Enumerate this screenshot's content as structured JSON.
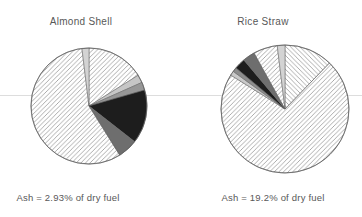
{
  "figure": {
    "background": "#ffffff",
    "text_color": "#585858",
    "baseline_rule_color": "#d9d9d9",
    "hatch_line_color": "#a4a4a4",
    "outline_color": "#5f5f5f"
  },
  "chart_data": [
    {
      "type": "pie",
      "title": "Almond Shell",
      "caption": "Ash = 2.93% of dry fuel",
      "legend": "none",
      "center_x": 89,
      "center_y": 106,
      "radius": 58,
      "slices": [
        {
          "name": "hatched-upper-right",
          "pattern": "hatch-ne",
          "percent": 16.1,
          "start": 0,
          "end": 58
        },
        {
          "name": "light-gray",
          "color": "#c6c6c6",
          "percent": 2.2,
          "start": 58,
          "end": 66
        },
        {
          "name": "medium-gray",
          "color": "#979797",
          "percent": 2.2,
          "start": 66,
          "end": 74
        },
        {
          "name": "black",
          "color": "#1d1d1d",
          "percent": 15.0,
          "start": 74,
          "end": 128
        },
        {
          "name": "dark-gray",
          "color": "#6e6e6e",
          "percent": 5.6,
          "start": 128,
          "end": 148
        },
        {
          "name": "hatched-large-left",
          "pattern": "hatch-ne",
          "percent": 56.9,
          "start": 148,
          "end": 353
        },
        {
          "name": "pale-gray-top",
          "color": "#d3d3d3",
          "percent": 1.9,
          "start": 353,
          "end": 360
        }
      ]
    },
    {
      "type": "pie",
      "title": "Rice Straw",
      "caption": "Ash = 19.2% of dry fuel",
      "legend": "none",
      "center_x": 285,
      "center_y": 109,
      "radius": 64,
      "slices": [
        {
          "name": "hatched-back-upper-right",
          "pattern": "hatch-nw",
          "percent": 12.2,
          "start": 0,
          "end": 44
        },
        {
          "name": "hatched-large-right",
          "pattern": "hatch-ne",
          "percent": 71.7,
          "start": 44,
          "end": 302
        },
        {
          "name": "light-gray-sliver",
          "color": "#c9c9c9",
          "percent": 1.1,
          "start": 302,
          "end": 306
        },
        {
          "name": "medium-gray-sliver",
          "color": "#8d8d8d",
          "percent": 1.1,
          "start": 306,
          "end": 310
        },
        {
          "name": "black",
          "color": "#1d1d1d",
          "percent": 2.8,
          "start": 310,
          "end": 320
        },
        {
          "name": "dark-gray",
          "color": "#6e6e6e",
          "percent": 3.1,
          "start": 320,
          "end": 331
        },
        {
          "name": "hatched-small-upper-left",
          "pattern": "hatch-ne",
          "percent": 6.1,
          "start": 331,
          "end": 353
        },
        {
          "name": "pale-gray-top",
          "color": "#d3d3d3",
          "percent": 1.9,
          "start": 353,
          "end": 360
        }
      ]
    }
  ]
}
